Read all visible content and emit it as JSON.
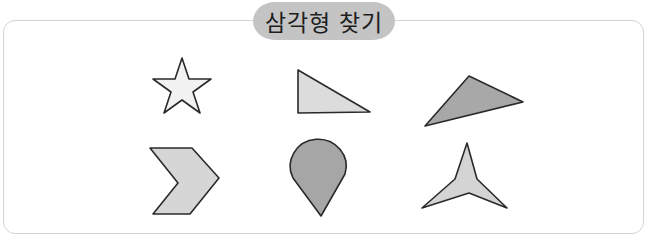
{
  "header": {
    "title": "삼각형 찾기"
  },
  "colors": {
    "pill": "#c4c4c4",
    "light_fill": "#e0e0e0",
    "mid_fill": "#d4d4d4",
    "dark_fill": "#a6a6a6",
    "star_fill": "#f2f2f2",
    "outline": "#2a2a2a",
    "frame": "#d4d4d4"
  },
  "shapes": [
    {
      "name": "star",
      "row": 1,
      "col": 1,
      "fill": "light-gray"
    },
    {
      "name": "right-triangle",
      "row": 1,
      "col": 2,
      "fill": "light-gray"
    },
    {
      "name": "obtuse-triangle",
      "row": 1,
      "col": 3,
      "fill": "dark-gray"
    },
    {
      "name": "chevron",
      "row": 2,
      "col": 1,
      "fill": "light-gray"
    },
    {
      "name": "teardrop",
      "row": 2,
      "col": 2,
      "fill": "dark-gray"
    },
    {
      "name": "concave-tripod",
      "row": 2,
      "col": 3,
      "fill": "light-gray"
    }
  ]
}
